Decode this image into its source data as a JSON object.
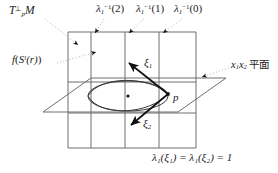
{
  "figure": {
    "title_note": "normal-space diagram",
    "background": "#ffffff",
    "line_color": "#6e6e6e",
    "accent_color": "#1a1a1a",
    "dotted_color": "#aaaaaa"
  },
  "labels": {
    "normal_space": {
      "base": "T",
      "sup": "⊥",
      "sub": "p",
      "manifold": "M",
      "full": "T⊥p M"
    },
    "image_sphere": {
      "f": "f",
      "open": "(",
      "s": "S",
      "sup": "l",
      "arg": "(r)",
      "close": ")",
      "full": "f(Sˡ(r))"
    },
    "level_sets": [
      {
        "name": "lambda-inv-2",
        "lambda": "λ",
        "sub": "1",
        "sup": "−1",
        "value": "(2)",
        "full": "λ₁⁻¹(2)"
      },
      {
        "name": "lambda-inv-1",
        "lambda": "λ",
        "sub": "1",
        "sup": "−1",
        "value": "(1)",
        "full": "λ₁⁻¹(1)"
      },
      {
        "name": "lambda-inv-0",
        "lambda": "λ",
        "sub": "1",
        "sup": "−1",
        "value": "(0)",
        "full": "λ₁⁻¹(0)"
      }
    ],
    "coordinate_plane": {
      "x": "x",
      "sub1": "1",
      "sub2": "2",
      "jp": "平面",
      "full": "x₁x₂ 平面"
    },
    "vector_xi1": {
      "symbol": "ξ",
      "sub": "1",
      "full": "ξ₁"
    },
    "vector_xi2": {
      "symbol": "ξ",
      "sub": "2",
      "full": "ξ₂"
    },
    "point_p": {
      "full": "p"
    },
    "equation": {
      "lhs_lambda": "λ",
      "lhs_sub": "1",
      "full": "λ₁(ξ₁) = λ₁(ξ₂) = 1",
      "value": "1"
    }
  },
  "geometry": {
    "grid": {
      "left": 68,
      "right": 196,
      "top": 32,
      "bottom": 148,
      "vertical_lines": [
        68,
        91,
        125,
        159,
        196
      ],
      "horizontal_lines": [
        32,
        82,
        113,
        148
      ]
    },
    "plane_parallelogram": [
      [
        43,
        112
      ],
      [
        91,
        78
      ],
      [
        226,
        78
      ],
      [
        178,
        112
      ]
    ],
    "point_p": {
      "x": 168,
      "y": 94
    },
    "lens_center": {
      "x": 128,
      "y": 96
    },
    "arrows": [
      {
        "name": "xi1-arrow",
        "from": [
          168,
          94
        ],
        "to": [
          128,
          63
        ]
      },
      {
        "name": "xi2-arrow",
        "from": [
          168,
          94
        ],
        "to": [
          130,
          125
        ]
      }
    ],
    "leader_dots": [
      {
        "name": "leader-tpm",
        "from": [
          45,
          18
        ],
        "to": [
          80,
          45
        ]
      },
      {
        "name": "leader-fsr",
        "from": [
          55,
          62
        ],
        "to": [
          95,
          50
        ]
      },
      {
        "name": "leader-l2",
        "from": [
          104,
          18
        ],
        "to": [
          94,
          33
        ]
      },
      {
        "name": "leader-l1",
        "from": [
          143,
          18
        ],
        "to": [
          128,
          33
        ]
      },
      {
        "name": "leader-l0",
        "from": [
          181,
          18
        ],
        "to": [
          162,
          33
        ]
      },
      {
        "name": "leader-plane",
        "from": [
          228,
          66
        ],
        "to": [
          200,
          76
        ]
      }
    ]
  }
}
